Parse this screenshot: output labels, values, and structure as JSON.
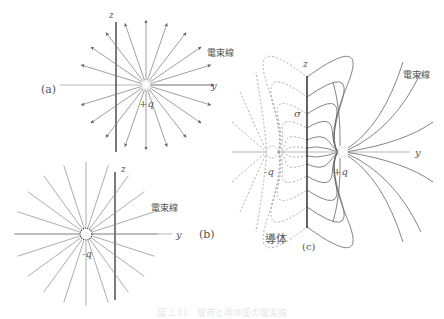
{
  "figure": {
    "panel_a": {
      "tag": "(a)",
      "axis_z": "z",
      "axis_y": "y",
      "charge_label": "+q",
      "line_label": "電束線"
    },
    "panel_b": {
      "tag": "(b)",
      "axis_z": "z",
      "axis_y": "y",
      "charge_label": "-q",
      "line_label": "電束線"
    },
    "panel_c": {
      "tag": "(c)",
      "axis_z": "z",
      "axis_y": "y",
      "charge_label_pos": "+q",
      "charge_label_neg": "-q",
      "sigma_label": "σ",
      "conductor_label": "導体",
      "line_label": "電束線"
    },
    "caption": "図 2.11　電荷と導体面の電束線"
  },
  "colors": {
    "line": "#777777",
    "axis": "#333333",
    "dashed": "#999999"
  }
}
